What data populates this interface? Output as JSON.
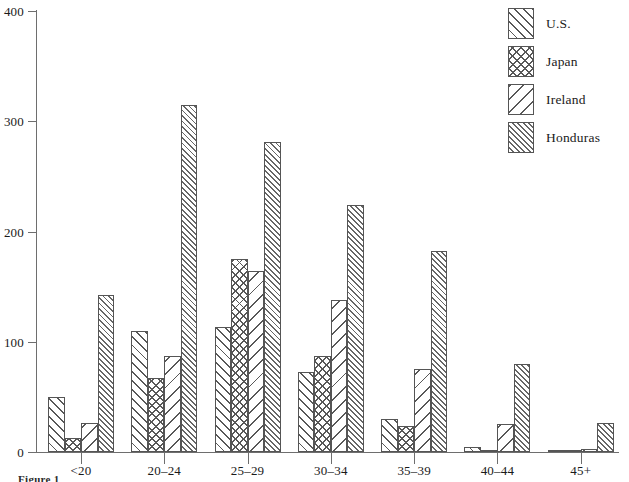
{
  "chart_data": {
    "type": "bar",
    "title": "",
    "subtitle": "",
    "xlabel": "",
    "ylabel": "",
    "categories": [
      "<20",
      "20–24",
      "25–29",
      "30–34",
      "35–39",
      "40–44",
      "45+"
    ],
    "series": [
      {
        "name": "U.S.",
        "pattern": "wide-diagonal-hatch",
        "values": [
          50,
          110,
          113,
          73,
          30,
          5,
          1
        ]
      },
      {
        "name": "Japan",
        "pattern": "cross-hatch",
        "values": [
          13,
          67,
          175,
          87,
          24,
          2,
          0
        ]
      },
      {
        "name": "Ireland",
        "pattern": "sparse-backslash-hatch",
        "values": [
          26,
          87,
          164,
          138,
          75,
          25,
          3
        ]
      },
      {
        "name": "Honduras",
        "pattern": "dense-diagonal-hatch",
        "values": [
          142,
          315,
          281,
          224,
          182,
          80,
          26
        ]
      }
    ],
    "ylim": [
      0,
      400
    ],
    "yticks": [
      0,
      100,
      200,
      300,
      400
    ],
    "ytick_labels": [
      "0",
      "100",
      "200",
      "300",
      "400"
    ],
    "grid": false,
    "legend_position": "top-right",
    "bar_edge_color": "#555555",
    "bar_face_color": "#ffffff",
    "axis_color": "#6e6e6e"
  },
  "legend": {
    "items": [
      {
        "label": "U.S."
      },
      {
        "label": "Japan"
      },
      {
        "label": "Ireland"
      },
      {
        "label": "Honduras"
      }
    ]
  },
  "caption": {
    "text": "Figure 1"
  }
}
